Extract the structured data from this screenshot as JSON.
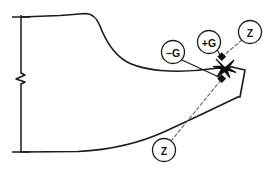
{
  "drawing": {
    "title": "Blade section detail",
    "background_color": "#ffffff",
    "line_color": "#1a1a1a",
    "dashed_line_color": "#6b6b6b",
    "width": 276,
    "height": 169
  },
  "callouts": [
    {
      "id": "minus-g",
      "label": "−G",
      "cx": 173,
      "cy": 52,
      "r": 11.5,
      "leader_type": "solid",
      "target_x": 222,
      "target_y": 79
    },
    {
      "id": "plus-g",
      "label": "+G",
      "cx": 209,
      "cy": 42,
      "r": 11.5,
      "leader_type": "solid",
      "target_x": 222,
      "target_y": 57
    },
    {
      "id": "z-upper",
      "label": "Z",
      "cx": 250,
      "cy": 32,
      "r": 11.5,
      "leader_type": "dashed",
      "target_x": 222,
      "target_y": 57
    },
    {
      "id": "z-lower",
      "label": "Z",
      "cx": 164,
      "cy": 150,
      "r": 11.5,
      "leader_type": "dashed",
      "target_x": 222,
      "target_y": 79
    }
  ],
  "markers": [
    {
      "id": "intersection-cross",
      "shape": "x-cross",
      "x": 225,
      "y": 68
    }
  ],
  "geometry": {
    "upper_profile_label": "upper blade surface",
    "lower_profile_label": "lower blade surface",
    "tip_polygon_label": "trailing edge tip",
    "centerline_label": "section break centerline"
  }
}
